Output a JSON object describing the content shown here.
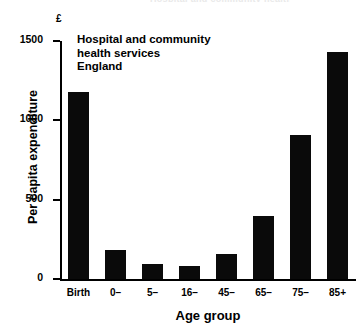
{
  "figure": {
    "cropped_top_title": "Hospital and community health",
    "unit_symbol": "£",
    "annotation_lines": [
      "Hospital and community",
      "health services",
      "England"
    ]
  },
  "chart_data": {
    "type": "bar",
    "title": "",
    "annotation": "Hospital and community health services England",
    "xlabel": "Age group",
    "ylabel": "Per capita expenditure",
    "yunit": "£",
    "categories": [
      "Birth",
      "0–",
      "5–",
      "16–",
      "45–",
      "65–",
      "75–",
      "85+"
    ],
    "values": [
      1180,
      185,
      95,
      80,
      155,
      400,
      910,
      1430
    ],
    "ylim": [
      0,
      1500
    ],
    "yticks": [
      0,
      500,
      1000,
      1500
    ],
    "ytick_labels": [
      "0",
      "500",
      "1000",
      "1500"
    ],
    "grid": false,
    "legend": false,
    "bar_color": "#0a0a0a"
  }
}
